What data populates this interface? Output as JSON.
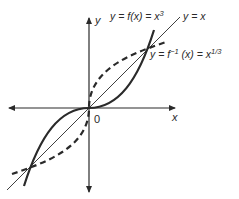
{
  "figure": {
    "axis_labels": {
      "x": "x",
      "y": "y",
      "origin": "0"
    },
    "curves": [
      {
        "name": "cube",
        "label": "y = f(x) = x",
        "exponent": "3",
        "style": "solid-thick"
      },
      {
        "name": "identity",
        "label": "y = x",
        "style": "solid-thin"
      },
      {
        "name": "cube-root",
        "label": "y = f",
        "inverse_sup": "−1",
        "label_rest": " (x) = x",
        "exponent": "1/3",
        "style": "dashed-thick"
      }
    ],
    "colors": {
      "ink": "#2a2a2a",
      "background": "#ffffff"
    }
  }
}
